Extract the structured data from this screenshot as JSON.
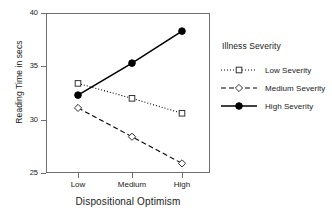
{
  "chart_data": {
    "type": "line",
    "title": "",
    "xlabel": "Dispositional Optimism",
    "ylabel": "Reading Time in secs",
    "categories": [
      "Low",
      "Medium",
      "High"
    ],
    "ylim": [
      25,
      40
    ],
    "yticks": [
      25,
      30,
      35,
      40
    ],
    "grid": false,
    "legend_position": "right",
    "legend_title": "Illness Severity",
    "series": [
      {
        "name": "Low Severity",
        "values": [
          33.4,
          32.0,
          30.6
        ],
        "line_style": "dotted",
        "marker": "open-square",
        "color": "#000000"
      },
      {
        "name": "Medium Severity",
        "values": [
          31.1,
          28.4,
          25.9
        ],
        "line_style": "dashed",
        "marker": "open-diamond",
        "color": "#000000"
      },
      {
        "name": "High Severity",
        "values": [
          32.3,
          35.3,
          38.3
        ],
        "line_style": "solid",
        "marker": "filled-circle",
        "color": "#000000"
      }
    ]
  }
}
